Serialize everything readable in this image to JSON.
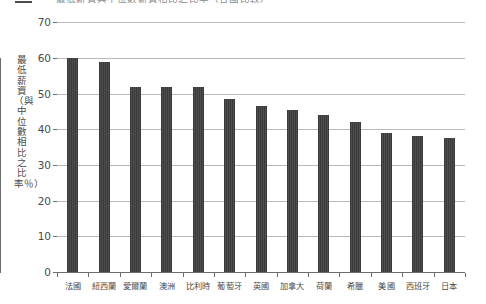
{
  "title": {
    "marker_name": "title-rule",
    "text": "最低薪資與中位數薪資相比之比率（各國比較）"
  },
  "axes": {
    "ylabel": "最低薪資（與中位數相比之比率％）",
    "yticks": [
      0,
      10,
      20,
      30,
      40,
      50,
      60,
      70
    ],
    "ymin": 0,
    "ymax": 70
  },
  "chart_data": {
    "type": "bar",
    "title": "最低薪資與中位數薪資相比之比率（各國比較）",
    "xlabel": "",
    "ylabel": "最低薪資（與中位數相比之比率％）",
    "ylim": [
      0,
      70
    ],
    "yticks": [
      0,
      10,
      20,
      30,
      40,
      50,
      60,
      70
    ],
    "grid": true,
    "legend": "none",
    "categories": [
      "法國",
      "紐西蘭",
      "愛爾蘭",
      "澳洲",
      "比利時",
      "葡萄牙",
      "英國",
      "加拿大",
      "荷蘭",
      "希臘",
      "美國",
      "西班牙",
      "日本"
    ],
    "values": [
      60.0,
      59.0,
      52.0,
      52.0,
      52.0,
      48.5,
      46.5,
      45.3,
      44.0,
      42.0,
      39.0,
      38.0,
      37.5
    ],
    "bar_color": "#3c3c3c"
  }
}
